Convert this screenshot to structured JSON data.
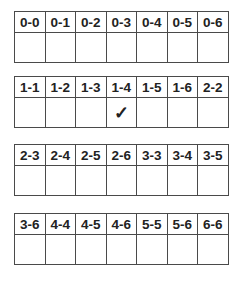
{
  "tables": [
    {
      "headers": [
        "0-0",
        "0-1",
        "0-2",
        "0-3",
        "0-4",
        "0-5",
        "0-6"
      ],
      "marks": [
        "",
        "",
        "",
        "",
        "",
        "",
        ""
      ]
    },
    {
      "headers": [
        "1-1",
        "1-2",
        "1-3",
        "1-4",
        "1-5",
        "1-6",
        "2-2"
      ],
      "marks": [
        "",
        "",
        "",
        "✓",
        "",
        "",
        ""
      ]
    },
    {
      "headers": [
        "2-3",
        "2-4",
        "2-5",
        "2-6",
        "3-3",
        "3-4",
        "3-5"
      ],
      "marks": [
        "",
        "",
        "",
        "",
        "",
        "",
        ""
      ]
    },
    {
      "headers": [
        "3-6",
        "4-4",
        "4-5",
        "4-6",
        "5-5",
        "5-6",
        "6-6"
      ],
      "marks": [
        "",
        "",
        "",
        "",
        "",
        "",
        ""
      ]
    }
  ],
  "colors": {
    "border": "#4a4a4a",
    "text": "#222222",
    "background": "#ffffff"
  }
}
